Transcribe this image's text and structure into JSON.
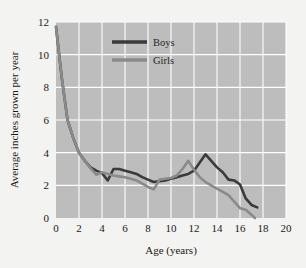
{
  "chart_data": {
    "type": "line",
    "title": "",
    "xlabel": "Age (years)",
    "ylabel": "Average inches grown per year",
    "xlim": [
      0,
      20
    ],
    "ylim": [
      0,
      12
    ],
    "xticks": [
      0,
      2,
      4,
      6,
      8,
      10,
      12,
      14,
      16,
      18,
      20
    ],
    "yticks": [
      0,
      2,
      4,
      6,
      8,
      10,
      12
    ],
    "grid": true,
    "legend_position": "top-center",
    "plot_background": "#bdbdbd",
    "grid_color": "#ffffff",
    "page_background": "#f3f3f1",
    "series": [
      {
        "name": "Boys",
        "color": "#3a3a3a",
        "x": [
          0,
          0.5,
          1,
          1.5,
          2,
          2.5,
          3,
          3.5,
          4,
          4.5,
          5,
          5.5,
          6,
          6.5,
          7,
          7.5,
          8,
          8.5,
          9,
          9.5,
          10,
          10.5,
          11,
          11.5,
          12,
          12.5,
          13,
          13.5,
          14,
          14.5,
          15,
          15.5,
          16,
          16.5,
          17,
          17.5
        ],
        "y": [
          11.7,
          8.6,
          6.0,
          4.9,
          4.0,
          3.5,
          3.1,
          2.9,
          2.75,
          2.3,
          3.0,
          3.0,
          2.9,
          2.8,
          2.7,
          2.5,
          2.35,
          2.2,
          2.25,
          2.3,
          2.4,
          2.5,
          2.6,
          2.7,
          2.9,
          3.4,
          3.9,
          3.5,
          3.1,
          2.8,
          2.35,
          2.3,
          2.05,
          1.2,
          0.8,
          0.65
        ]
      },
      {
        "name": "Girls",
        "color": "#8a8a8a",
        "x": [
          0,
          0.5,
          1,
          1.5,
          2,
          2.5,
          3,
          3.5,
          4,
          4.5,
          5,
          5.5,
          6,
          6.5,
          7,
          7.5,
          8,
          8.5,
          9,
          9.5,
          10,
          10.5,
          11,
          11.5,
          12,
          12.5,
          13,
          13.5,
          14,
          14.5,
          15,
          15.5,
          16,
          16.5,
          17,
          17.3
        ],
        "y": [
          11.7,
          8.6,
          6.0,
          4.9,
          4.0,
          3.5,
          3.05,
          2.65,
          2.8,
          2.7,
          2.6,
          2.55,
          2.5,
          2.4,
          2.3,
          2.1,
          1.9,
          1.75,
          2.35,
          2.4,
          2.45,
          2.6,
          3.0,
          3.5,
          2.95,
          2.5,
          2.2,
          2.0,
          1.8,
          1.6,
          1.4,
          1.0,
          0.6,
          0.5,
          0.2,
          0.0
        ]
      }
    ]
  },
  "legend": {
    "items": [
      {
        "label": "Boys"
      },
      {
        "label": "Girls"
      }
    ]
  },
  "axes": {
    "x_title": "Age (years)",
    "y_title": "Average inches grown per year",
    "x_tick_labels": [
      "0",
      "2",
      "4",
      "6",
      "8",
      "10",
      "12",
      "14",
      "16",
      "18",
      "20"
    ],
    "y_tick_labels": [
      "0",
      "2",
      "4",
      "6",
      "8",
      "10",
      "12"
    ]
  }
}
